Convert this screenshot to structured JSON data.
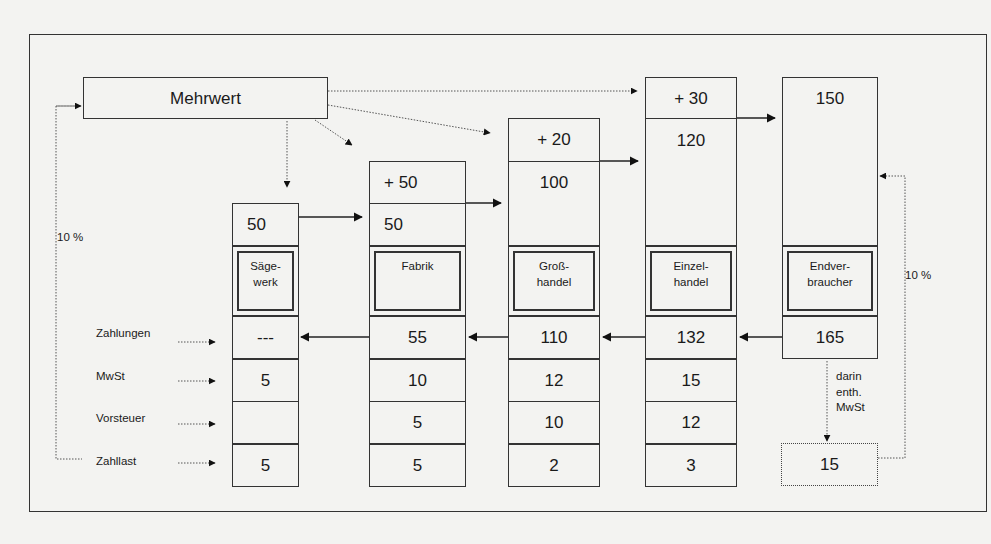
{
  "diagram": {
    "title": "Mehrwert",
    "row_labels": [
      "Zahlungen",
      "MwSt",
      "Vorsteuer",
      "Zahllast"
    ],
    "left_loop_label": "10 %",
    "right_loop_label": "10 %",
    "included_vat_note": [
      "darin",
      "enth.",
      "MwSt"
    ],
    "included_vat_value": "15",
    "columns": [
      {
        "name_line1": "Säge-",
        "name_line2": "werk",
        "added_value": "",
        "input_value": "50",
        "zahlungen": "---",
        "mwst": "5",
        "vorsteuer": "",
        "zahllast": "5"
      },
      {
        "name_line1": "Fabrik",
        "name_line2": "",
        "added_value": "+ 50",
        "input_value": "50",
        "zahlungen": "55",
        "mwst": "10",
        "vorsteuer": "5",
        "zahllast": "5"
      },
      {
        "name_line1": "Groß-",
        "name_line2": "handel",
        "added_value": "+ 20",
        "input_value": "100",
        "zahlungen": "110",
        "mwst": "12",
        "vorsteuer": "10",
        "zahllast": "2"
      },
      {
        "name_line1": "Einzel-",
        "name_line2": "handel",
        "added_value": "+ 30",
        "input_value": "120",
        "zahlungen": "132",
        "mwst": "15",
        "vorsteuer": "12",
        "zahllast": "3"
      },
      {
        "name_line1": "Endver-",
        "name_line2": "braucher",
        "added_value": "",
        "input_value": "150",
        "zahlungen": "165",
        "mwst": "",
        "vorsteuer": "",
        "zahllast": ""
      }
    ]
  }
}
